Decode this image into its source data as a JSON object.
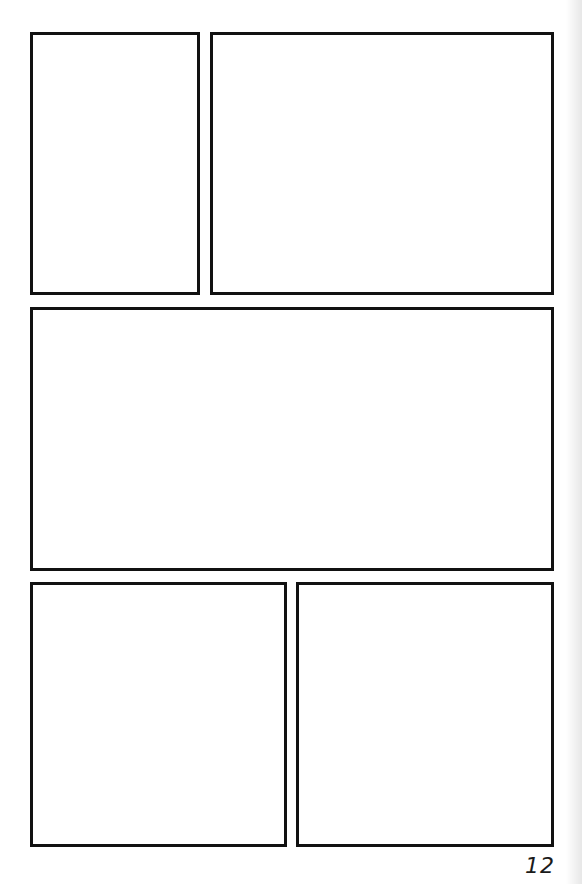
{
  "page": {
    "type": "comic-panel-template",
    "page_number": "12",
    "border_color": "#111111",
    "background_color": "#ffffff"
  },
  "panels": [
    {
      "id": "panel-1",
      "row": 1,
      "x": 30,
      "y": 32,
      "w": 170,
      "h": 263
    },
    {
      "id": "panel-2",
      "row": 1,
      "x": 210,
      "y": 32,
      "w": 344,
      "h": 263
    },
    {
      "id": "panel-3",
      "row": 2,
      "x": 30,
      "y": 307,
      "w": 524,
      "h": 264
    },
    {
      "id": "panel-4",
      "row": 3,
      "x": 30,
      "y": 582,
      "w": 257,
      "h": 265
    },
    {
      "id": "panel-5",
      "row": 3,
      "x": 296,
      "y": 582,
      "w": 258,
      "h": 265
    }
  ]
}
